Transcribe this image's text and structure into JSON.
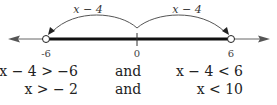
{
  "number_line": {
    "arc_labels": [
      "x − 4",
      "x − 4"
    ],
    "tick_labels": [
      "-6",
      "0",
      "6"
    ],
    "endpoints": [
      {
        "value": -6,
        "type": "open"
      },
      {
        "value": 6,
        "type": "open"
      }
    ],
    "shaded_interval": [
      -6,
      6
    ],
    "colors": {
      "axis": "#555555",
      "interval": "#111111",
      "arc": "#444444"
    }
  },
  "inequalities": [
    {
      "left": "x − 4 > −6",
      "conj": "and",
      "right": "x − 4 <  6"
    },
    {
      "left": "x > − 2",
      "conj": "and",
      "right": "x < 10"
    }
  ]
}
